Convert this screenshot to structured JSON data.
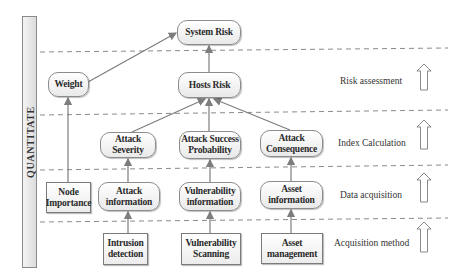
{
  "side_bar": {
    "label": "QUANTITATE"
  },
  "nodes": {
    "system_risk": "System Risk",
    "hosts_risk": "Hosts Risk",
    "weight": "Weight",
    "node_importance": "Node Importance",
    "attack_severity": "Attack Severity",
    "attack_success_probability": "Attack Success Probability",
    "attack_consequence": "Attack Consequence",
    "attack_information": "Attack information",
    "vulnerability_information": "Vulnerability information",
    "asset_information": "Asset information",
    "intrusion_detection": "Intrusion detection",
    "vulnerability_scanning": "Vulnerability Scanning",
    "asset_management": "Asset management"
  },
  "layers": [
    {
      "label": "Risk assessment"
    },
    {
      "label": "Index Calculation"
    },
    {
      "label": "Data acquisition"
    },
    {
      "label": "Acquisition method"
    }
  ],
  "edges": [
    {
      "from": "weight",
      "to": "system_risk"
    },
    {
      "from": "hosts_risk",
      "to": "system_risk"
    },
    {
      "from": "node_importance",
      "to": "weight"
    },
    {
      "from": "attack_severity",
      "to": "hosts_risk"
    },
    {
      "from": "attack_success_probability",
      "to": "hosts_risk"
    },
    {
      "from": "attack_consequence",
      "to": "hosts_risk"
    },
    {
      "from": "attack_information",
      "to": "attack_severity"
    },
    {
      "from": "vulnerability_information",
      "to": "attack_success_probability"
    },
    {
      "from": "asset_information",
      "to": "attack_consequence"
    },
    {
      "from": "intrusion_detection",
      "to": "attack_information"
    },
    {
      "from": "vulnerability_scanning",
      "to": "vulnerability_information"
    },
    {
      "from": "asset_management",
      "to": "asset_information"
    }
  ],
  "colors": {
    "line": "#8a8a8a",
    "node_border": "#8c8c8c",
    "text": "#2a2a2a"
  }
}
